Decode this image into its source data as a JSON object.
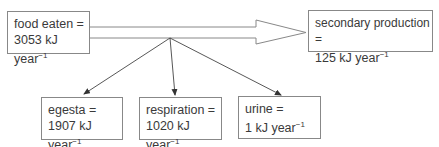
{
  "diagram": {
    "nodes": {
      "food_eaten": {
        "label": "food eaten =",
        "value": "3053 kJ year",
        "exp": "−1"
      },
      "secondary_production": {
        "label": "secondary production =",
        "value": "125 kJ year",
        "exp": "−1"
      },
      "egesta": {
        "label": "egesta =",
        "value": "1907 kJ year",
        "exp": "−1"
      },
      "respiration": {
        "label": "respiration =",
        "value": "1020 kJ year",
        "exp": "−1"
      },
      "urine": {
        "label": "urine =",
        "value": "1 kJ year",
        "exp": "−1"
      }
    },
    "edges": [
      {
        "from": "food_eaten",
        "to": "secondary_production",
        "style": "large-hollow-arrow"
      },
      {
        "from": "food_eaten",
        "to": "egesta",
        "style": "thin-arrow"
      },
      {
        "from": "food_eaten",
        "to": "respiration",
        "style": "thin-arrow"
      },
      {
        "from": "food_eaten",
        "to": "urine",
        "style": "thin-arrow"
      }
    ],
    "colors": {
      "line": "#888888",
      "arrow": "#333333",
      "text": "#3a3a3a"
    }
  }
}
